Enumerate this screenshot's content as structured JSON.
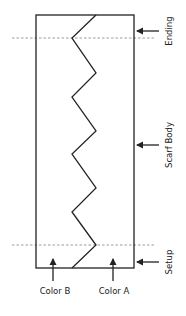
{
  "diagram": {
    "colors": {
      "stroke": "#222222",
      "dashed": "#9a9a9a",
      "background": "#ffffff"
    },
    "box": {
      "x": 36,
      "y": 15,
      "width": 98,
      "height": 253
    },
    "zigzag_points": "96,15 72,38 96,73 72,97 96,131 72,154 96,188 72,212 96,245 72,268",
    "dashed_lines": [
      {
        "name": "ending-boundary",
        "y": 38
      },
      {
        "name": "setup-boundary",
        "y": 245
      }
    ],
    "sections": [
      {
        "label": "Ending",
        "arrow_y": 31
      },
      {
        "label": "Scarf Body",
        "arrow_y": 145
      },
      {
        "label": "Setup",
        "arrow_y": 262
      }
    ],
    "colors_legend": [
      {
        "label": "Color B",
        "arrow_x": 53
      },
      {
        "label": "Color A",
        "arrow_x": 113
      }
    ]
  }
}
